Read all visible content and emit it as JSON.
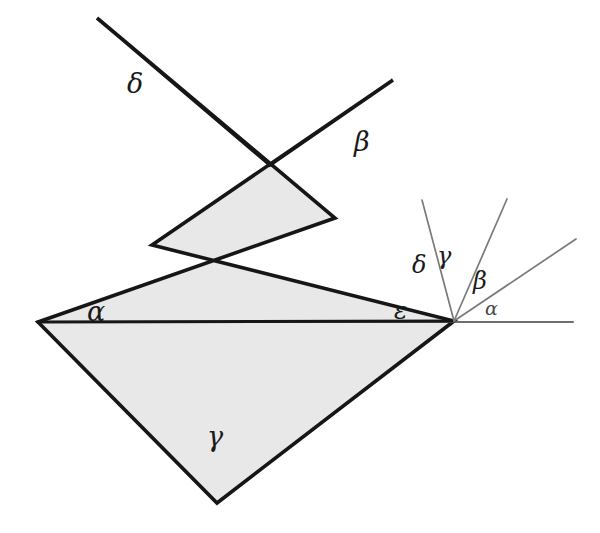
{
  "figure": {
    "canvas": {
      "width": 600,
      "height": 533
    },
    "colors": {
      "background": "#ffffff",
      "star_fill": "#e8e8e8",
      "star_stroke": "#161616",
      "baseline_stroke": "#6e6e6e",
      "fan_ray_stroke": "#7a7a7a",
      "label_color": "#1a1a1a",
      "label_color_faint": "#4a4a4a"
    },
    "stroke_widths": {
      "star_outline": 3.6,
      "baseline": 2.2,
      "fan_ray": 1.7
    }
  },
  "star": {
    "name": "pentagram",
    "points": [
      {
        "id": "alpha-point",
        "label": "α",
        "x": 38,
        "y": 322
      },
      {
        "id": "delta-point",
        "label": "δ",
        "x": 97,
        "y": 18
      },
      {
        "id": "beta-point",
        "label": "β",
        "x": 393,
        "y": 80
      },
      {
        "id": "epsilon-point",
        "label": "ε",
        "x": 454,
        "y": 321
      },
      {
        "id": "gamma-point",
        "label": "γ",
        "x": 217,
        "y": 503
      }
    ],
    "outline_path": "M 38 322 L 335 218 L 97 18 L 270 165 L 393 80 L 152 245 L 454 321 L 217 503 Z",
    "labels": [
      {
        "id": "star-label-delta",
        "text": "δ",
        "x": 127,
        "y": 70,
        "size": 27
      },
      {
        "id": "star-label-beta",
        "text": "β",
        "x": 354,
        "y": 128,
        "size": 27
      },
      {
        "id": "star-label-alpha",
        "text": "α",
        "x": 87,
        "y": 298,
        "size": 27
      },
      {
        "id": "star-label-epsilon",
        "text": "ε",
        "x": 394,
        "y": 298,
        "size": 25
      },
      {
        "id": "star-label-gamma",
        "text": "γ",
        "x": 207,
        "y": 423,
        "size": 27
      }
    ]
  },
  "fan": {
    "description": "Angles transferred to the right vertex, summing to a straight angle",
    "vertex": {
      "x": 454,
      "y": 321
    },
    "baseline": {
      "x1": 38,
      "y1": 322,
      "x2": 573,
      "y2": 322
    },
    "rays": [
      {
        "id": "fan-ray-delta-gamma",
        "x2": 422,
        "y2": 200
      },
      {
        "id": "fan-ray-gamma-beta",
        "x2": 507,
        "y2": 199
      },
      {
        "id": "fan-ray-beta-alpha",
        "x2": 576,
        "y2": 239
      }
    ],
    "labels": [
      {
        "id": "fan-label-delta",
        "text": "δ",
        "x": 412,
        "y": 253,
        "size": 24,
        "faint": false
      },
      {
        "id": "fan-label-gamma",
        "text": "γ",
        "x": 437,
        "y": 244,
        "size": 24,
        "faint": false
      },
      {
        "id": "fan-label-beta",
        "text": "β",
        "x": 473,
        "y": 269,
        "size": 24,
        "faint": false
      },
      {
        "id": "fan-label-alpha",
        "text": "α",
        "x": 485,
        "y": 299,
        "size": 19,
        "faint": true
      }
    ]
  },
  "chart_data": {
    "type": "diagram",
    "subtype": "geometric-figure",
    "greek_letters_used": [
      "α",
      "β",
      "γ",
      "δ",
      "ε"
    ],
    "star_point_labels": [
      "δ",
      "β",
      "α",
      "ε",
      "γ"
    ],
    "fan_labels_left_to_right": [
      "δ",
      "γ",
      "β",
      "α"
    ],
    "relationship": "α + β + γ + δ + ε = 180°"
  }
}
